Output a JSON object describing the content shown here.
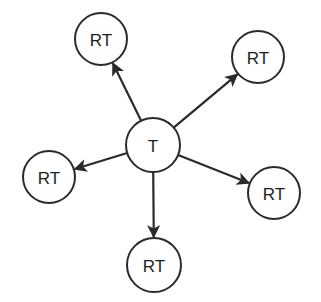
{
  "diagram": {
    "type": "star-graph",
    "center": {
      "id": "T",
      "label": "T",
      "x": 153,
      "y": 145,
      "r": 27
    },
    "nodes": [
      {
        "id": "rt-top-left",
        "label": "RT",
        "x": 101,
        "y": 39,
        "r": 26
      },
      {
        "id": "rt-top-right",
        "label": "RT",
        "x": 258,
        "y": 57,
        "r": 26
      },
      {
        "id": "rt-left",
        "label": "RT",
        "x": 49,
        "y": 177,
        "r": 26
      },
      {
        "id": "rt-right",
        "label": "RT",
        "x": 274,
        "y": 193,
        "r": 26
      },
      {
        "id": "rt-bottom",
        "label": "RT",
        "x": 154,
        "y": 265,
        "r": 27
      }
    ],
    "edges": [
      {
        "from": "T",
        "to": "rt-top-left",
        "directed": true
      },
      {
        "from": "T",
        "to": "rt-top-right",
        "directed": true
      },
      {
        "from": "T",
        "to": "rt-left",
        "directed": true
      },
      {
        "from": "T",
        "to": "rt-right",
        "directed": true
      },
      {
        "from": "T",
        "to": "rt-bottom",
        "directed": true
      }
    ],
    "colors": {
      "stroke": "#2a2a2a",
      "fill": "#ffffff",
      "background": "#ffffff"
    }
  }
}
